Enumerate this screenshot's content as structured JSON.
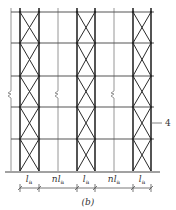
{
  "figure": {
    "caption": "(b)",
    "callout": {
      "label": "4",
      "x_from": 151,
      "x_to": 162,
      "y": 123
    },
    "colors": {
      "thick": "#2a2a2a",
      "thin": "#8a8a8a",
      "text": "#333333"
    },
    "grid": {
      "rails_y": [
        12,
        43,
        76,
        107,
        139
      ],
      "ground_y": 171,
      "rail_x_start": 11,
      "rail_x_end": 154,
      "ground_x_start": 5,
      "ground_x_end": 160,
      "top_y": 8
    },
    "braced_bays": [
      {
        "x_left": 20,
        "x_right": 39
      },
      {
        "x_left": 77,
        "x_right": 95
      },
      {
        "x_left": 133,
        "x_right": 151
      }
    ],
    "thin_posts_x": [
      11,
      58,
      114
    ],
    "break_marks": [
      {
        "x": 11,
        "y": 93
      },
      {
        "x": 58,
        "y": 93
      },
      {
        "x": 114,
        "y": 93
      }
    ],
    "dimensions": {
      "line_y": 188,
      "label_y": 182,
      "ticks_x": [
        20,
        39,
        77,
        95,
        133,
        151
      ],
      "segments": [
        {
          "main": "l",
          "sub": "a",
          "prefix": "",
          "x": 29
        },
        {
          "main": "l",
          "sub": "a",
          "prefix": "n",
          "x": 58
        },
        {
          "main": "l",
          "sub": "a",
          "prefix": "",
          "x": 86
        },
        {
          "main": "l",
          "sub": "a",
          "prefix": "n",
          "x": 114
        },
        {
          "main": "l",
          "sub": "a",
          "prefix": "",
          "x": 142
        }
      ]
    }
  }
}
